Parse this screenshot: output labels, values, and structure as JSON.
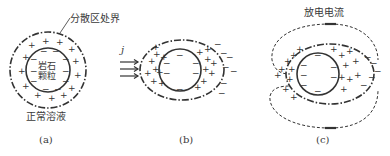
{
  "panels": [
    {
      "id": "a",
      "caption": "(a)",
      "particle_label_line1": "岩石",
      "particle_label_line2": "颗粒",
      "boundary_label": "分散区处界",
      "solution_label": "正常溶液"
    },
    {
      "id": "b",
      "caption": "(b)",
      "current_symbol": "j"
    },
    {
      "id": "c",
      "caption": "(c)",
      "discharge_label": "放电电流"
    }
  ],
  "colors": {
    "ink": "#333333",
    "background": "#ffffff"
  }
}
